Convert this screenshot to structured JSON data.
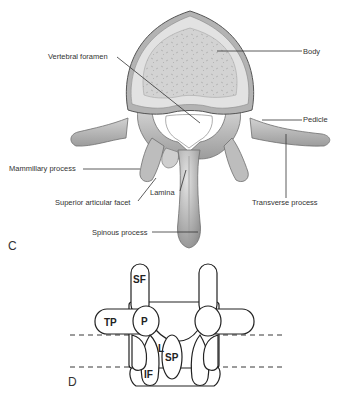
{
  "figure": {
    "panel_c": {
      "letter": "C",
      "description": "Superior view of lumbar vertebra",
      "labels": {
        "body": "Body",
        "vertebral_foramen": "Vertebral foramen",
        "pedicle": "Pedicle",
        "mammillary_process": "Mammillary process",
        "superior_articular_facet": "Superior articular facet",
        "lamina": "Lamina",
        "transverse_process": "Transverse process",
        "spinous_process": "Spinous process"
      }
    },
    "panel_d": {
      "letter": "D",
      "description": "Schematic posterior view of lumbar vertebra",
      "labels": {
        "sf": "SF",
        "tp": "TP",
        "p": "P",
        "l": "L",
        "sp": "SP",
        "if": "IF"
      }
    }
  },
  "colors": {
    "bone_fill": "#c9c9c9",
    "bone_dark": "#8a8a8a",
    "bone_light": "#e6e6e6",
    "cortex_ring": "#dedede",
    "line": "#333333",
    "text": "#333333"
  }
}
